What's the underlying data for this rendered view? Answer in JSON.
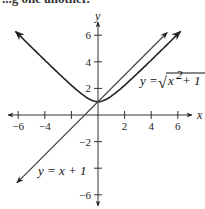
{
  "caption_fragment": "...g one another.",
  "chart_data": {
    "type": "line",
    "title": "",
    "xlabel": "x",
    "ylabel": "y",
    "xlim": [
      -7,
      7
    ],
    "ylim": [
      -7,
      7
    ],
    "x_ticks": [
      -6,
      -4,
      -2,
      2,
      4,
      6
    ],
    "x_tick_labels": [
      "-6",
      "-4",
      "",
      "2",
      "4",
      "6"
    ],
    "y_ticks": [
      -6,
      -4,
      -2,
      2,
      4,
      6
    ],
    "y_tick_labels": [
      "-6",
      "",
      "-2",
      "2",
      "4",
      "6"
    ],
    "grid": false,
    "series": [
      {
        "name": "y = √(x² + 1)",
        "label_parts": {
          "lhs": "y = ",
          "radicand": "x",
          "exp": "2",
          "rest": " + 1"
        },
        "function": "sqrt(x^2+1)",
        "x_range": [
          -6.2,
          6.2
        ],
        "points": [
          [
            -6,
            6.08
          ],
          [
            -4,
            4.12
          ],
          [
            -2,
            2.24
          ],
          [
            -1,
            1.41
          ],
          [
            0,
            1
          ],
          [
            1,
            1.41
          ],
          [
            2,
            2.24
          ],
          [
            4,
            4.12
          ],
          [
            6,
            6.08
          ]
        ],
        "arrows": "both",
        "color": "#222222"
      },
      {
        "name": "y = x + 1",
        "label": "y = x + 1",
        "function": "x+1",
        "x_range": [
          -6.1,
          5.2
        ],
        "points": [
          [
            -6,
            -5
          ],
          [
            -4,
            -3
          ],
          [
            -2,
            -1
          ],
          [
            0,
            1
          ],
          [
            2,
            3
          ],
          [
            4,
            5
          ],
          [
            5.2,
            6.2
          ]
        ],
        "arrows": "both",
        "color": "#444444"
      }
    ]
  }
}
